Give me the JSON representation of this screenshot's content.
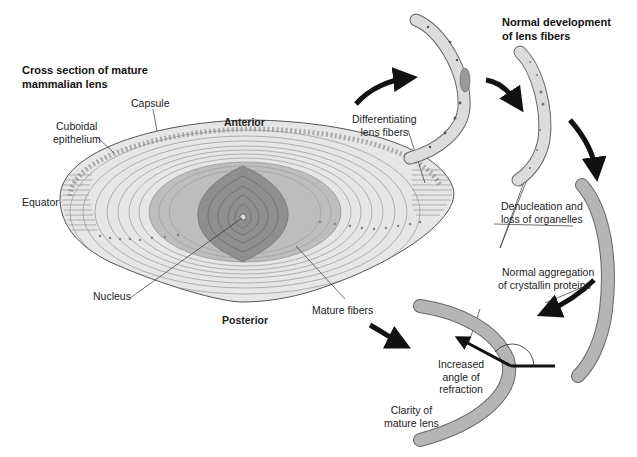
{
  "titles": {
    "cross_section": [
      "Cross section of mature",
      "mammalian lens"
    ],
    "development": [
      "Normal development",
      "of lens fibers"
    ]
  },
  "labels": {
    "capsule": "Capsule",
    "cuboidal_epithelium": [
      "Cuboidal",
      "epithelium"
    ],
    "equator": "Equator",
    "anterior": "Anterior",
    "posterior": "Posterior",
    "nucleus": "Nucleus",
    "mature_fibers": "Mature fibers",
    "differentiating": [
      "Differentiating",
      "lens fibers"
    ],
    "denucleation": [
      "Denucleation and",
      "loss of organelles"
    ],
    "aggregation": [
      "Normal aggregation",
      "of crystallin proteins"
    ],
    "refraction": [
      "Increased",
      "angle of",
      "refraction"
    ],
    "clarity": [
      "Clarity of",
      "mature lens"
    ]
  },
  "colors": {
    "lens_fill": "#e6e6e6",
    "ring_line": "#8a8a8a",
    "mid_zone": "#bdbdbd",
    "nucleus_zone": "#8e8e8e",
    "nucleus_core": "#6f6f6f",
    "fiber_fill": "#d9d9d9",
    "mature_fiber_fill": "#b5b5b5",
    "arrow": "#111111"
  }
}
